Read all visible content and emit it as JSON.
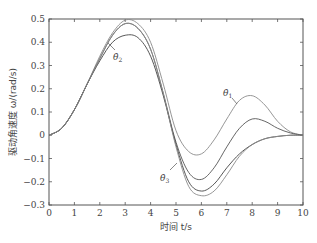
{
  "chart_data": {
    "type": "line",
    "title": "",
    "xlabel": "时间 t/s",
    "ylabel": "驱动角速度 ω/(rad/s)",
    "xlim": [
      0,
      10
    ],
    "ylim": [
      -0.3,
      0.5
    ],
    "xticks": [
      0,
      1,
      2,
      3,
      4,
      5,
      6,
      7,
      8,
      9,
      10
    ],
    "yticks": [
      -0.3,
      -0.2,
      -0.1,
      0,
      0.1,
      0.2,
      0.3,
      0.4,
      0.5
    ],
    "grid": false,
    "legend": "inline annotations",
    "x": [
      0,
      0.5,
      1,
      1.5,
      2,
      2.5,
      3,
      3.5,
      4,
      4.5,
      5,
      5.5,
      6,
      6.5,
      7,
      7.5,
      8,
      8.5,
      9,
      9.5,
      10
    ],
    "series": [
      {
        "name": "θ̇1",
        "values": [
          0,
          0.03,
          0.11,
          0.22,
          0.34,
          0.44,
          0.495,
          0.48,
          0.4,
          0.22,
          0.02,
          -0.07,
          -0.08,
          -0.02,
          0.07,
          0.15,
          0.17,
          0.13,
          0.06,
          0.015,
          0
        ]
      },
      {
        "name": "middle",
        "values": [
          0,
          0.03,
          0.11,
          0.22,
          0.33,
          0.43,
          0.48,
          0.46,
          0.37,
          0.18,
          -0.03,
          -0.16,
          -0.19,
          -0.14,
          -0.05,
          0.03,
          0.07,
          0.06,
          0.03,
          0.01,
          0
        ]
      },
      {
        "name": "θ̇2",
        "values": [
          0,
          0.03,
          0.11,
          0.22,
          0.32,
          0.4,
          0.43,
          0.42,
          0.34,
          0.17,
          -0.04,
          -0.2,
          -0.24,
          -0.21,
          -0.14,
          -0.08,
          -0.04,
          -0.015,
          -0.005,
          0,
          0
        ]
      },
      {
        "name": "θ̇3",
        "values": [
          0,
          0.03,
          0.11,
          0.22,
          0.33,
          0.43,
          0.48,
          0.46,
          0.37,
          0.18,
          -0.05,
          -0.22,
          -0.26,
          -0.24,
          -0.17,
          -0.09,
          -0.04,
          -0.015,
          -0.005,
          0,
          0
        ]
      }
    ],
    "annotations": [
      {
        "text": "θ̇2",
        "x": 3.2,
        "y": 0.37
      },
      {
        "text": "θ̇1",
        "x": 7.3,
        "y": 0.22
      },
      {
        "text": "θ̇3",
        "x": 4.3,
        "y": -0.14
      }
    ]
  },
  "labels": {
    "xlabel": "时间 t/s",
    "ylabel": "驱动角速度 ω/(rad/s)",
    "ann1": "θ̇",
    "ann1_sub": "1",
    "ann2": "θ̇",
    "ann2_sub": "2",
    "ann3": "θ̇",
    "ann3_sub": "3"
  }
}
